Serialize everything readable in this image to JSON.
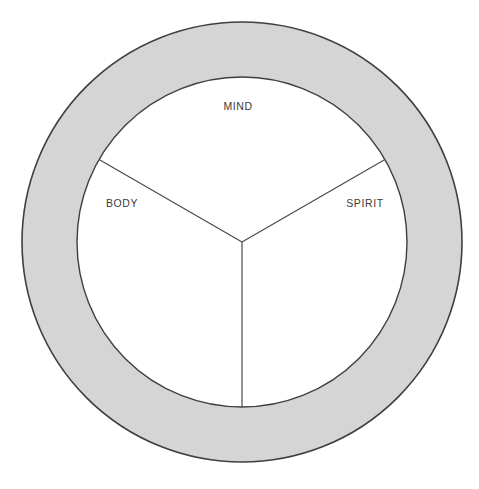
{
  "diagram": {
    "type": "ring-with-three-sectors",
    "canvas": {
      "width": 479,
      "height": 489,
      "background": "#ffffff"
    },
    "geometry": {
      "center_x": 242,
      "center_y": 242,
      "outer_radius": 220,
      "inner_radius": 165,
      "ring_thickness": 55,
      "spoke_angles_degrees": [
        90,
        210,
        330
      ],
      "sector_count": 3
    },
    "colors": {
      "ring_fill": "#d5d5d5",
      "inner_fill": "#ffffff",
      "stroke": "#3f3f3f",
      "divider_stroke": "#4a4a4a",
      "label_text": "#3a3a3a",
      "background": "#ffffff"
    },
    "ring": {
      "name": "outer-ring",
      "fill": "#d5d5d5",
      "stroke_width": 1.6
    },
    "inner_circle": {
      "name": "inner-circle",
      "fill": "#ffffff",
      "stroke_width": 1.4
    },
    "sectors": [
      {
        "id": "mind",
        "label": "MIND",
        "label_x": 238,
        "label_y": 110,
        "text_anchor": "middle",
        "span_degrees": 120,
        "position": "top"
      },
      {
        "id": "body",
        "label": "BODY",
        "label_x": 122,
        "label_y": 207,
        "text_anchor": "middle",
        "span_degrees": 120,
        "position": "left"
      },
      {
        "id": "spirit",
        "label": "SPIRIT",
        "label_x": 365,
        "label_y": 207,
        "text_anchor": "middle",
        "span_degrees": 120,
        "position": "right"
      }
    ],
    "dividers": [
      {
        "id": "divider-bottom",
        "from": "center",
        "to_x": 242,
        "to_y": 407
      },
      {
        "id": "divider-upper-left",
        "from": "center",
        "to_x": 99,
        "to_y": 159.5
      },
      {
        "id": "divider-upper-right",
        "from": "center",
        "to_x": 385,
        "to_y": 159.5
      }
    ]
  }
}
